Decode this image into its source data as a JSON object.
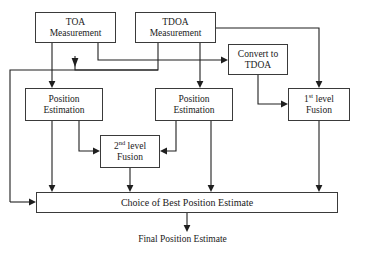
{
  "diagram": {
    "nodes": {
      "toa_measurement": {
        "line1": "TOA",
        "line2": "Measurement"
      },
      "tdoa_measurement": {
        "line1": "TDOA",
        "line2": "Measurement"
      },
      "convert_to_tdoa": {
        "line1": "Convert to",
        "line2": "TDOA"
      },
      "position_estimation_left": {
        "line1": "Position",
        "line2": "Estimation"
      },
      "position_estimation_middle": {
        "line1": "Position",
        "line2": "Estimation"
      },
      "first_level_fusion": {
        "prefix": "1",
        "sup": "st",
        "suffix": " level",
        "line2": "Fusion"
      },
      "second_level_fusion": {
        "prefix": "2",
        "sup": "nd",
        "suffix": " level",
        "line2": "Fusion"
      },
      "choice_of_best": {
        "label": "Choice of Best Position Estimate"
      }
    },
    "labels": {
      "final_output": "Final Position Estimate"
    },
    "colors": {
      "stroke": "#1f1f1f",
      "box_border": "#3a3a3a",
      "background": "#ffffff",
      "text": "#1a1a1a"
    }
  }
}
